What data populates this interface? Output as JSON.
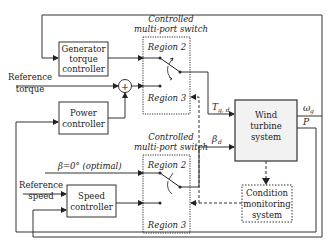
{
  "blocks": {
    "generator_torque_controller": [
      "Generator",
      "torque",
      "controller"
    ],
    "power_controller": [
      "Power",
      "controller"
    ],
    "speed_controller": [
      "Speed",
      "controller"
    ],
    "wind_turbine_system": [
      "Wind",
      "turbine",
      "system"
    ],
    "condition_monitoring_system": [
      "Condition",
      "monitoring",
      "system"
    ]
  },
  "switches": {
    "top": {
      "title": [
        "Controlled",
        "multi-port switch"
      ],
      "region_a": "Region 2",
      "region_b": "Region 3"
    },
    "bottom": {
      "title": [
        "Controlled",
        "multi-port switch"
      ],
      "region_a": "Region 2",
      "region_b": "Region 3"
    }
  },
  "inputs": {
    "reference_torque": [
      "Reference",
      "torque"
    ],
    "reference_speed": [
      "Reference",
      "speed"
    ],
    "beta_optimal": "β=0° (optimal)"
  },
  "signals": {
    "tg_d": "T",
    "tg_d_sub": "g, d",
    "beta_d": "β",
    "beta_d_sub": "d",
    "omega_g": "ω",
    "omega_g_sub": "g",
    "power": "P"
  },
  "summing_junction": {
    "symbol": "+"
  },
  "colors": {
    "line": "#333333",
    "block_fill": "#f2f2f2",
    "plain_fill": "#ffffff"
  }
}
